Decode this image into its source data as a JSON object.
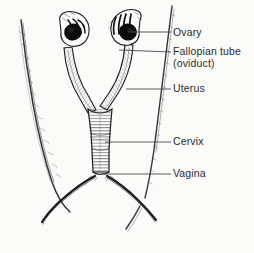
{
  "figure": {
    "background_color": "#fbfbf9",
    "ink_color": "#1a1a1a",
    "leader_line_color": "#4a4a4a",
    "label_text_color": "#2b2b2b"
  },
  "labels": {
    "ovary": "Ovary",
    "fallopian_tube": "Fallopian tube",
    "fallopian_tube_alt": "(oviduct)",
    "uterus": "Uterus",
    "cervix": "Cervix",
    "vagina": "Vagina"
  },
  "leaders": [
    {
      "name": "ovary",
      "x1": 128,
      "y1": 32,
      "x2": 171,
      "y2": 32
    },
    {
      "name": "fallopian-tube",
      "x1": 119,
      "y1": 50,
      "x2": 171,
      "y2": 52
    },
    {
      "name": "uterus",
      "x1": 126,
      "y1": 89,
      "x2": 171,
      "y2": 89
    },
    {
      "name": "cervix",
      "x1": 105,
      "y1": 142,
      "x2": 171,
      "y2": 142
    },
    {
      "name": "vagina",
      "x1": 100,
      "y1": 174,
      "x2": 171,
      "y2": 174
    }
  ],
  "anatomy_parts": [
    "left-ovary",
    "right-ovary",
    "left-infundibulum-fimbriae",
    "right-infundibulum-fimbriae",
    "left-uterine-horn",
    "right-uterine-horn",
    "uterine-body",
    "cervix",
    "vagina",
    "pelvic-outline-left",
    "pelvic-outline-right",
    "body-contour-left",
    "body-contour-right"
  ]
}
